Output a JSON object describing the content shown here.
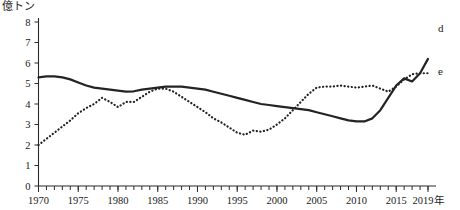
{
  "chart_data": {
    "type": "line",
    "title": "",
    "unit_label": "億トン",
    "xlabel": "",
    "ylabel": "",
    "x_axis_suffix": "年",
    "grid": false,
    "legend_position": "right-end-of-line",
    "xlim": [
      1970,
      2019
    ],
    "ylim": [
      0,
      8
    ],
    "y_ticks": [
      0,
      1,
      2,
      3,
      4,
      5,
      6,
      7,
      8
    ],
    "y_tick_labels": [
      "0",
      "1",
      "2",
      "3",
      "4",
      "5",
      "6",
      "7",
      "8"
    ],
    "x_ticks": [
      1970,
      1975,
      1980,
      1985,
      1990,
      1995,
      2000,
      2005,
      2010,
      2015,
      2019
    ],
    "x_tick_labels": [
      "1970",
      "1975",
      "1980",
      "1985",
      "1990",
      "1995",
      "2000",
      "2005",
      "2010",
      "2015",
      "2019年"
    ],
    "x_minor_tick_step": 1,
    "x": [
      1970,
      1971,
      1972,
      1973,
      1974,
      1975,
      1976,
      1977,
      1978,
      1979,
      1980,
      1981,
      1982,
      1983,
      1984,
      1985,
      1986,
      1987,
      1988,
      1989,
      1990,
      1991,
      1992,
      1993,
      1994,
      1995,
      1996,
      1997,
      1998,
      1999,
      2000,
      2001,
      2002,
      2003,
      2004,
      2005,
      2006,
      2007,
      2008,
      2009,
      2010,
      2011,
      2012,
      2013,
      2014,
      2015,
      2016,
      2017,
      2018,
      2019
    ],
    "series": [
      {
        "name": "d",
        "label": "d",
        "style": "solid",
        "color": "#232323",
        "values": [
          5.3,
          5.35,
          5.35,
          5.3,
          5.2,
          5.05,
          4.9,
          4.8,
          4.75,
          4.7,
          4.65,
          4.6,
          4.62,
          4.7,
          4.75,
          4.8,
          4.85,
          4.85,
          4.85,
          4.8,
          4.75,
          4.7,
          4.6,
          4.5,
          4.4,
          4.3,
          4.2,
          4.1,
          4.0,
          3.95,
          3.9,
          3.85,
          3.8,
          3.75,
          3.7,
          3.6,
          3.5,
          3.4,
          3.3,
          3.2,
          3.15,
          3.15,
          3.3,
          3.7,
          4.3,
          4.9,
          5.25,
          5.1,
          5.5,
          6.2
        ]
      },
      {
        "name": "e",
        "label": "e",
        "style": "dotted",
        "color": "#232323",
        "values": [
          2.0,
          2.3,
          2.6,
          2.9,
          3.2,
          3.55,
          3.8,
          4.0,
          4.3,
          4.1,
          3.85,
          4.1,
          4.1,
          4.35,
          4.6,
          4.75,
          4.75,
          4.6,
          4.35,
          4.1,
          3.85,
          3.6,
          3.3,
          3.1,
          2.85,
          2.6,
          2.5,
          2.7,
          2.65,
          2.75,
          3.0,
          3.3,
          3.7,
          4.1,
          4.5,
          4.8,
          4.85,
          4.85,
          4.9,
          4.85,
          4.8,
          4.85,
          4.9,
          4.75,
          4.6,
          4.85,
          5.2,
          5.45,
          5.5,
          5.5
        ]
      }
    ],
    "annotations": [
      {
        "text": "d",
        "near_x": 2019,
        "near_y": 7.7
      },
      {
        "text": "e",
        "near_x": 2019,
        "near_y": 5.6
      }
    ]
  }
}
